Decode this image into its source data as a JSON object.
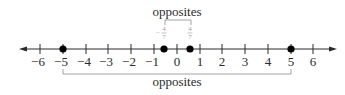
{
  "diagram": {
    "type": "number-line",
    "axis": {
      "min": -6,
      "max": 6,
      "step": 1,
      "arrows": [
        "left",
        "right"
      ],
      "tick_labels": [
        "−6",
        "−5",
        "−4",
        "−3",
        "−2",
        "−1",
        "0",
        "1",
        "2",
        "3",
        "4",
        "5",
        "6"
      ]
    },
    "points": [
      {
        "value": -5,
        "label": ""
      },
      {
        "value": -0.5714,
        "label": "−4/7"
      },
      {
        "value": 0.5714,
        "label": "4/7"
      },
      {
        "value": 5,
        "label": ""
      }
    ],
    "fraction_labels": {
      "neg": {
        "sign": "−",
        "numerator": "4",
        "denominator": "7"
      },
      "pos": {
        "numerator": "4",
        "denominator": "7"
      }
    },
    "brackets": {
      "top": {
        "label": "opposites",
        "from": "−4/7",
        "to": "4/7"
      },
      "bottom": {
        "label": "opposites",
        "from": "−5",
        "to": "5"
      }
    },
    "colors": {
      "line": "#2a2a2a",
      "bracket": "#8c8c8c",
      "fraction": "#9a9a9a",
      "point": "#000000"
    }
  }
}
